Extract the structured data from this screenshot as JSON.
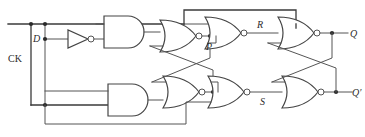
{
  "diagram": {
    "type": "logic-circuit",
    "width": 365,
    "height": 137,
    "background": "#ffffff",
    "wire_color": "#555555",
    "gate_stroke": "#444444",
    "label_color": "#2b2b2b"
  },
  "labels": {
    "d_input": "D",
    "ck_input": "CK",
    "node_p": "P",
    "node_r": "R",
    "node_s": "S",
    "out_q": "Q",
    "out_qnot": "Q′"
  },
  "gates": [
    {
      "id": "and-top",
      "kind": "AND",
      "label": "AND",
      "inputs": 2,
      "inverted_output": false
    },
    {
      "id": "and-bottom",
      "kind": "AND",
      "label": "AND",
      "inputs": 2,
      "inverted_output": false
    },
    {
      "id": "nor-p",
      "kind": "NOR",
      "label": "NOR",
      "inputs": 2,
      "inverted_output": true
    },
    {
      "id": "nor-lower",
      "kind": "NOR",
      "label": "NOR",
      "inputs": 2,
      "inverted_output": true
    },
    {
      "id": "nor-r",
      "kind": "NOR",
      "label": "NOR",
      "inputs": 2,
      "inverted_output": true
    },
    {
      "id": "nor-s",
      "kind": "NOR",
      "label": "NOR",
      "inputs": 2,
      "inverted_output": true
    },
    {
      "id": "nor-q",
      "kind": "NOR",
      "label": "NOR",
      "inputs": 2,
      "inverted_output": true
    },
    {
      "id": "nor-qnot",
      "kind": "NOR",
      "label": "NOR",
      "inputs": 2,
      "inverted_output": true
    },
    {
      "id": "inverter-d",
      "kind": "NOT",
      "label": "NOT",
      "inputs": 1,
      "inverted_output": true
    }
  ],
  "nodes": [
    {
      "id": "D",
      "label": "D"
    },
    {
      "id": "CK",
      "label": "CK"
    },
    {
      "id": "P",
      "label": "P"
    },
    {
      "id": "R",
      "label": "R"
    },
    {
      "id": "S",
      "label": "S"
    },
    {
      "id": "Q",
      "label": "Q"
    },
    {
      "id": "Qn",
      "label": "Q′"
    }
  ]
}
